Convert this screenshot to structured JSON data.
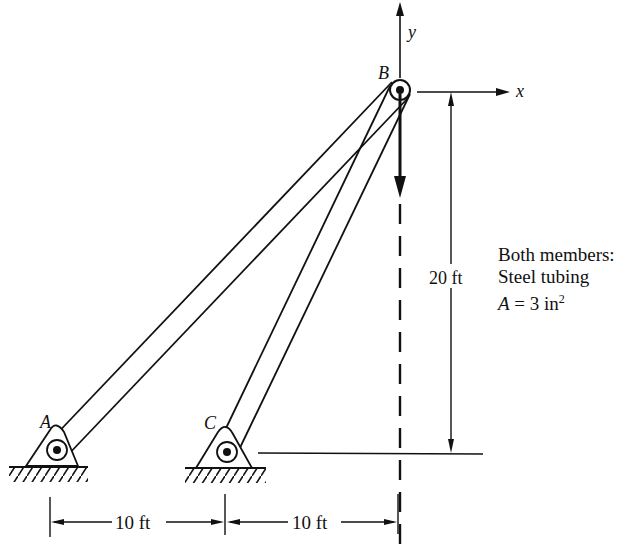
{
  "figure": {
    "type": "two-member truss with load",
    "points": {
      "A": {
        "label": "A"
      },
      "B": {
        "label": "B"
      },
      "C": {
        "label": "C"
      }
    },
    "axes": {
      "x_label": "x",
      "y_label": "y"
    },
    "dimensions": {
      "height": "20 ft",
      "horizontal_AC": "10 ft",
      "horizontal_CB": "10 ft"
    },
    "note": {
      "line1": "Both members:",
      "line2": "Steel tubing",
      "line3_var": "A",
      "line3_eq": " = 3 in",
      "line3_exp": "2"
    }
  }
}
